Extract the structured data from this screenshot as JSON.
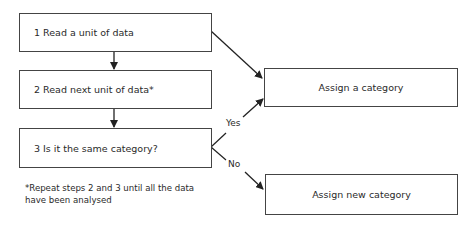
{
  "diagram": {
    "type": "flowchart",
    "steps": [
      {
        "id": "step1",
        "label": "1  Read a unit of data"
      },
      {
        "id": "step2",
        "label": "2  Read next unit of data*"
      },
      {
        "id": "step3",
        "label": "3  Is it the same category?"
      }
    ],
    "outcomes": [
      {
        "id": "assign",
        "label": "Assign a category"
      },
      {
        "id": "assign_new",
        "label": "Assign new category"
      }
    ],
    "branches": {
      "yes": "Yes",
      "no": "No"
    },
    "edges": [
      {
        "from": "step1",
        "to": "step2"
      },
      {
        "from": "step2",
        "to": "step3"
      },
      {
        "from": "step1",
        "to": "assign"
      },
      {
        "from": "step3",
        "to": "assign",
        "label": "Yes"
      },
      {
        "from": "step3",
        "to": "assign_new",
        "label": "No"
      }
    ],
    "footnote": {
      "line1": "*Repeat steps 2 and 3 until all the data",
      "line2": "have been analysed"
    }
  }
}
